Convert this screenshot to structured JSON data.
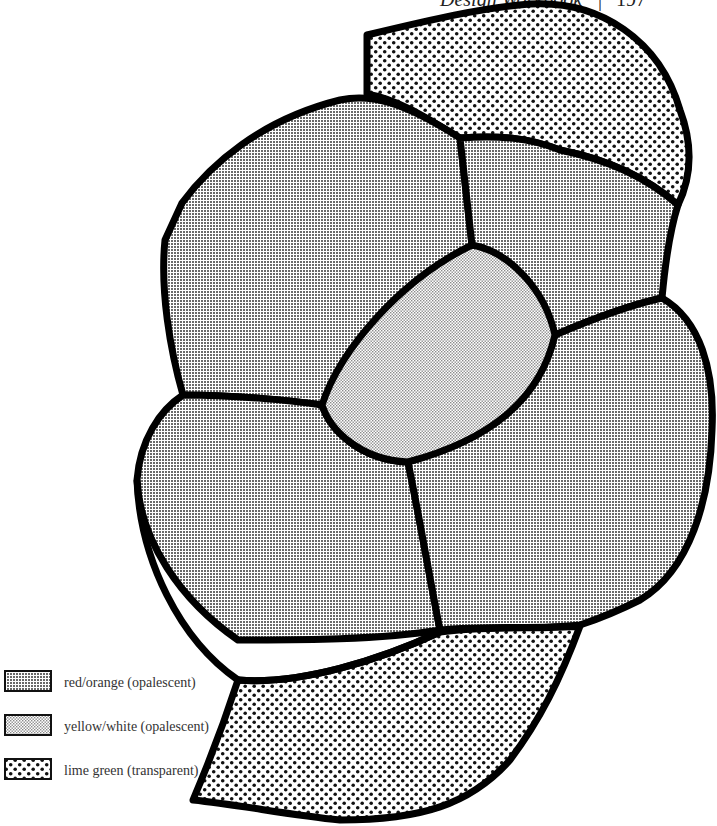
{
  "header": {
    "running_title": "Design Workbook",
    "page_number": "197"
  },
  "diagram": {
    "outline_color": "#000000",
    "pieces": [
      {
        "id": "top-right-band",
        "material": "lime green (transparent)"
      },
      {
        "id": "upper-left",
        "material": "red/orange (opalescent)"
      },
      {
        "id": "upper-right",
        "material": "red/orange (opalescent)"
      },
      {
        "id": "center",
        "material": "yellow/white (opalescent)"
      },
      {
        "id": "lower-left",
        "material": "red/orange (opalescent)"
      },
      {
        "id": "lower-right",
        "material": "red/orange (opalescent)"
      },
      {
        "id": "bottom-band",
        "material": "lime green (transparent)"
      }
    ]
  },
  "legend": {
    "items": [
      {
        "label": "red/orange (opalescent)",
        "pattern": "dense-grid"
      },
      {
        "label": "yellow/white (opalescent)",
        "pattern": "fine-stipple"
      },
      {
        "label": "lime green (transparent)",
        "pattern": "coarse-dots"
      }
    ]
  }
}
